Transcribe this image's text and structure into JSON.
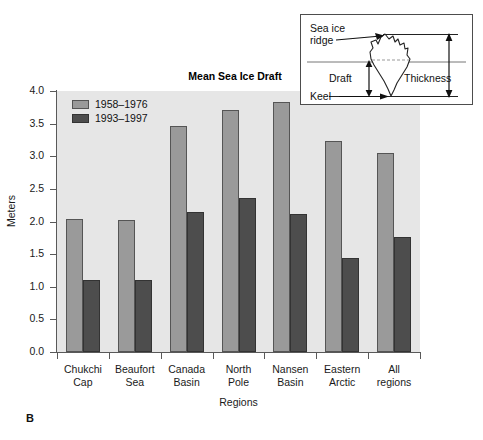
{
  "panel": {
    "letter": "B"
  },
  "chart_data": {
    "type": "bar",
    "title": "Mean Sea Ice Draft",
    "xlabel": "Regions",
    "ylabel": "Meters",
    "ylim": [
      0.0,
      4.0
    ],
    "ytick_step": 0.5,
    "ytick_labels": [
      "0.0",
      "0.5",
      "1.0",
      "1.5",
      "2.0",
      "2.5",
      "3.0",
      "3.5",
      "4.0"
    ],
    "ytick_values": [
      0.0,
      0.5,
      1.0,
      1.5,
      2.0,
      2.5,
      3.0,
      3.5,
      4.0
    ],
    "grid": false,
    "legend_position": "top-left-inside",
    "categories": [
      "Chukchi\nCap",
      "Beaufort\nSea",
      "Canada\nBasin",
      "North\nPole",
      "Nansen\nBasin",
      "Eastern\nArctic",
      "All\nregions"
    ],
    "category_lines": [
      [
        "Chukchi",
        "Cap"
      ],
      [
        "Beaufort",
        "Sea"
      ],
      [
        "Canada",
        "Basin"
      ],
      [
        "North",
        "Pole"
      ],
      [
        "Nansen",
        "Basin"
      ],
      [
        "Eastern",
        "Arctic"
      ],
      [
        "All",
        "regions"
      ]
    ],
    "series": [
      {
        "name": "1958–1976",
        "color": "#9a9a9a",
        "values": [
          2.04,
          2.03,
          3.46,
          3.71,
          3.83,
          3.23,
          3.05
        ]
      },
      {
        "name": "1993–1997",
        "color": "#4d4d4d",
        "values": [
          1.11,
          1.11,
          2.14,
          2.36,
          2.12,
          1.44,
          1.77
        ]
      }
    ]
  },
  "inset": {
    "labels": {
      "sea_ice_ridge_line1": "Sea ice",
      "sea_ice_ridge_line2": "ridge",
      "draft": "Draft",
      "thickness": "Thickness",
      "keel": "Keel"
    }
  },
  "colors": {
    "series_light": "#9a9a9a",
    "series_dark": "#4d4d4d",
    "plot_background": "#e6e6e6",
    "axis": "#595959",
    "page_background": "#ffffff"
  }
}
